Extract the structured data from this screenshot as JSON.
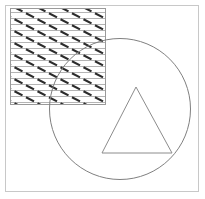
{
  "figure": {
    "title": "Geometric composition: hatched square overlapping a circle containing a triangle",
    "canvas": {
      "width": 205,
      "height": 199,
      "background": "#ffffff"
    },
    "colors": {
      "frame_stroke": "#c8c8c8",
      "square_stroke": "#9a9a9a",
      "hatch_line": "#b4b4b4",
      "hatch_dash": "#2b2b2b",
      "circle_stroke": "#808080",
      "triangle_stroke": "#8c8c8c",
      "fill": "#ffffff"
    },
    "shapes": [
      {
        "name": "outer-frame",
        "type": "rectangle",
        "x": 5.5,
        "y": 5.5,
        "width": 193,
        "height": 186,
        "stroke_width": 1
      },
      {
        "name": "hatched-square",
        "type": "rectangle",
        "x": 10.5,
        "y": 8.5,
        "width": 95,
        "height": 96,
        "stroke_width": 1,
        "pattern": "horizontal-lines-with-diagonal-dashes",
        "pattern_line_spacing": 6,
        "pattern_dash_spacing_x": 23,
        "pattern_dash_row_offset": 11,
        "pattern_dash_length": 9,
        "pattern_dash_angle_deg": 35
      },
      {
        "name": "circle",
        "type": "circle",
        "cx": 120,
        "cy": 109,
        "r": 70.5,
        "stroke_width": 1
      },
      {
        "name": "triangle",
        "type": "polygon",
        "points": "136,87 172,153 102,153",
        "stroke_width": 1
      }
    ]
  }
}
